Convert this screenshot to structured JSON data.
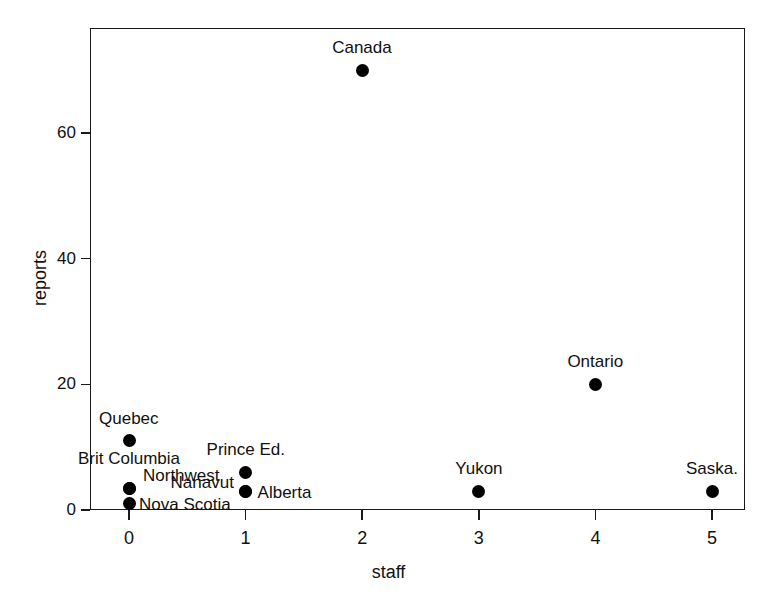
{
  "chart_data": {
    "type": "scatter",
    "title": "",
    "xlabel": "staff",
    "ylabel": "reports",
    "xlim": [
      -0.4,
      5.65
    ],
    "ylim": [
      -1.5,
      75
    ],
    "grid": false,
    "legend": "none",
    "xticks": [
      0,
      1,
      2,
      3,
      4,
      5
    ],
    "yticks": [
      0,
      20,
      40,
      60
    ],
    "xtick_labels": [
      "0",
      "1",
      "2",
      "3",
      "4",
      "5"
    ],
    "ytick_labels": [
      "0",
      "20",
      "40",
      "60"
    ],
    "points": [
      {
        "label": "Canada",
        "x": 2,
        "y": 70,
        "label_dx": 0,
        "label_dy": -22,
        "label_anchor": "center"
      },
      {
        "label": "Ontario",
        "x": 4,
        "y": 20,
        "label_dx": 0,
        "label_dy": -22,
        "label_anchor": "center"
      },
      {
        "label": "Quebec",
        "x": 0,
        "y": 11,
        "label_dx": 0,
        "label_dy": -22,
        "label_anchor": "center"
      },
      {
        "label": "Prince Ed.",
        "x": 1,
        "y": 6,
        "label_dx": 0,
        "label_dy": -22,
        "label_anchor": "center"
      },
      {
        "label": "Brit Columbia",
        "x": 0,
        "y": 3.5,
        "label_dx": 0,
        "label_dy": -29,
        "label_anchor": "center"
      },
      {
        "label": "Northwest",
        "x": 0,
        "y": 3.5,
        "label_dx": 14,
        "label_dy": -12,
        "label_anchor": "left"
      },
      {
        "label": "Nova Scotia",
        "x": 0,
        "y": 1,
        "label_dx": 10,
        "label_dy": 1,
        "label_anchor": "left"
      },
      {
        "label": "Nanavut",
        "x": 1,
        "y": 3,
        "label_dx": -12,
        "label_dy": -8,
        "label_anchor": "right"
      },
      {
        "label": "Alberta",
        "x": 1,
        "y": 3,
        "label_dx": 12,
        "label_dy": 2,
        "label_anchor": "left"
      },
      {
        "label": "Yukon",
        "x": 3,
        "y": 3,
        "label_dx": 0,
        "label_dy": -22,
        "label_anchor": "center"
      },
      {
        "label": "Saska.",
        "x": 5,
        "y": 3,
        "label_dx": 0,
        "label_dy": -22,
        "label_anchor": "center"
      }
    ],
    "colors": {
      "marker": "#000000",
      "axis": "#1a1a1a",
      "background": "#ffffff"
    }
  }
}
